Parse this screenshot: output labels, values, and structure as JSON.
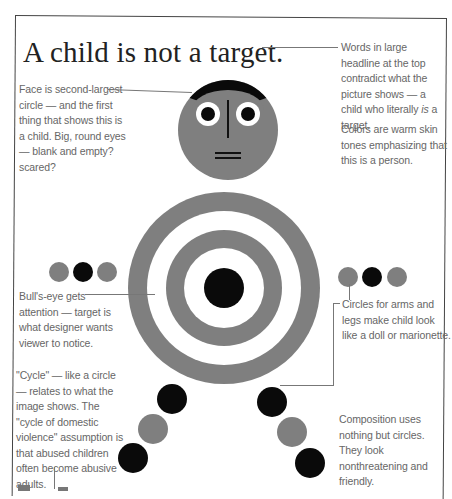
{
  "page": {
    "headline": "A child is not a target.",
    "annotations": {
      "headline_note": "Words in large headline at the top contradict what the picture shows — a child who literally is a target.",
      "headline_note_parts": {
        "before": "Words in large headline at the top contradict what the picture shows — a child who literally ",
        "emphasis": "is",
        "after": " a target."
      },
      "colors_note": "Colors are warm skin tones emphasizing that this is a person.",
      "face_note": "Face is second-largest circle — and the first thing that shows this is a child. Big, round eyes — blank and empty? scared?",
      "bullseye_note": "Bull's-eye gets attention — target is what designer wants viewer to notice.",
      "limbs_note": "Circles for arms and legs make child look like a doll or marionette.",
      "cycle_note": "\"Cycle\" — like a circle — relates to what the image shows. The \"cycle of domestic violence\" assumption is that abused children often become abusive adults.",
      "composition_note": "Composition uses nothing but circles. They look nonthreatening and friendly."
    },
    "figure": {
      "face": {
        "color": "#7f7f7f",
        "hair_color": "#0a0a0a",
        "eyes": 2
      },
      "target": {
        "rings": [
          "#7f7f7f",
          "#ffffff",
          "#7f7f7f",
          "#ffffff",
          "#0a0a0a"
        ]
      },
      "left_arm": [
        "#7f7f7f",
        "#0a0a0a",
        "#7f7f7f"
      ],
      "right_arm": [
        "#7f7f7f",
        "#0a0a0a",
        "#7f7f7f"
      ],
      "left_leg": [
        "#0a0a0a",
        "#7f7f7f",
        "#0a0a0a"
      ],
      "right_leg": [
        "#0a0a0a",
        "#7f7f7f",
        "#0a0a0a"
      ]
    }
  }
}
